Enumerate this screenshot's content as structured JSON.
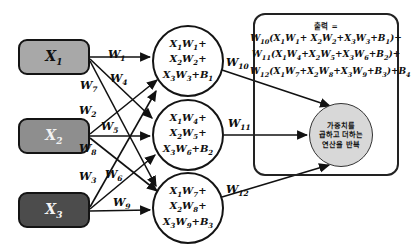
{
  "diagram": {
    "inputs": [
      {
        "name": "x1",
        "base": "X",
        "sub": "1",
        "fill": "#a8a8a8",
        "text_color": "#111111"
      },
      {
        "name": "x2",
        "base": "X",
        "sub": "2",
        "fill": "#8e8e8e",
        "text_color": "#f2f2f2"
      },
      {
        "name": "x3",
        "base": "X",
        "sub": "3",
        "fill": "#4c4c4c",
        "text_color": "#f4f4f4"
      }
    ],
    "hidden_nodes": [
      {
        "name": "hidden-node-1",
        "lines": [
          {
            "t1": "X",
            "s1": "1",
            "t2": "W",
            "s2": "1",
            "tail": "+"
          },
          {
            "t1": "X",
            "s1": "2",
            "t2": "W",
            "s2": "2",
            "tail": "+"
          },
          {
            "t1": "X",
            "s1": "3",
            "t2": "W",
            "s2": "3",
            "tail": "+B",
            "stail": "1"
          }
        ]
      },
      {
        "name": "hidden-node-2",
        "lines": [
          {
            "t1": "X",
            "s1": "1",
            "t2": "W",
            "s2": "4",
            "tail": "+"
          },
          {
            "t1": "X",
            "s1": "2",
            "t2": "W",
            "s2": "5",
            "tail": "+"
          },
          {
            "t1": "X",
            "s1": "3",
            "t2": "W",
            "s2": "6",
            "tail": "+B",
            "stail": "2"
          }
        ]
      },
      {
        "name": "hidden-node-3",
        "lines": [
          {
            "t1": "X",
            "s1": "1",
            "t2": "W",
            "s2": "7",
            "tail": "+"
          },
          {
            "t1": "X",
            "s1": "2",
            "t2": "W",
            "s2": "8",
            "tail": "+"
          },
          {
            "t1": "X",
            "s1": "3",
            "t2": "W",
            "s2": "9",
            "tail": "+B",
            "stail": "3"
          }
        ]
      }
    ],
    "weights": [
      {
        "name": "weight-w1",
        "base": "W",
        "sub": "1",
        "x": 108,
        "y": 48
      },
      {
        "name": "weight-w4",
        "base": "W",
        "sub": "4",
        "x": 110,
        "y": 72
      },
      {
        "name": "weight-w7",
        "base": "W",
        "sub": "7",
        "x": 80,
        "y": 79
      },
      {
        "name": "weight-w2",
        "base": "W",
        "sub": "2",
        "x": 79,
        "y": 104
      },
      {
        "name": "weight-w5",
        "base": "W",
        "sub": "5",
        "x": 101,
        "y": 120
      },
      {
        "name": "weight-w8",
        "base": "W",
        "sub": "8",
        "x": 79,
        "y": 142
      },
      {
        "name": "weight-w3",
        "base": "W",
        "sub": "3",
        "x": 79,
        "y": 170
      },
      {
        "name": "weight-w6",
        "base": "W",
        "sub": "6",
        "x": 105,
        "y": 168
      },
      {
        "name": "weight-w9",
        "base": "W",
        "sub": "9",
        "x": 113,
        "y": 196
      },
      {
        "name": "weight-w10",
        "base": "W",
        "sub": "10",
        "x": 226,
        "y": 56
      },
      {
        "name": "weight-w11",
        "base": "W",
        "sub": "11",
        "x": 228,
        "y": 117
      },
      {
        "name": "weight-w12",
        "base": "W",
        "sub": "12",
        "x": 226,
        "y": 183
      }
    ],
    "output_panel": {
      "header": "출력 =",
      "formula_lines": [
        {
          "name": "formula-line-1",
          "html": "W<sub>10</sub>(X<sub>1</sub>W<sub>1</sub>+ X<sub>2</sub>W<sub>2</sub>+X<sub>3</sub>W<sub>3</sub>+B<sub>1</sub>)+"
        },
        {
          "name": "formula-line-2",
          "html": "W<sub>11</sub>(X<sub>1</sub>W<sub>4</sub>+X<sub>2</sub>W<sub>5</sub>+X<sub>3</sub>W<sub>6</sub>+B<sub>2</sub>)+"
        },
        {
          "name": "formula-line-3",
          "html": "W<sub>12</sub>(X<sub>1</sub>W<sub>7</sub>+X<sub>2</sub>W<sub>8</sub>+X<sub>3</sub>W<sub>9</sub>+B<sub>3</sub>)+B<sub>4</sub>"
        }
      ],
      "output_circle": {
        "name": "output-operation-circle",
        "lines": [
          "가중치를",
          "곱하고 더하는",
          "연산을 반복"
        ],
        "fill": "#d8d8d8"
      }
    },
    "colors": {
      "stroke": "#141414",
      "panel_stroke": "#222222",
      "background": "#ffffff"
    }
  }
}
